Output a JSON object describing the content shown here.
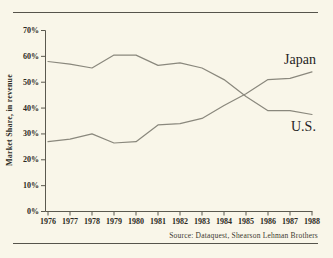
{
  "chart_data": {
    "type": "line",
    "x": [
      1976,
      1977,
      1978,
      1979,
      1980,
      1981,
      1982,
      1983,
      1984,
      1985,
      1986,
      1987,
      1988
    ],
    "xtick_labels": [
      "1976",
      "1977",
      "1978",
      "1979",
      "1980",
      "1981",
      "1982",
      "1983",
      "1984",
      "1985",
      "1986",
      "1987",
      "1988"
    ],
    "series": [
      {
        "name": "U.S.",
        "values": [
          58,
          57,
          55.5,
          60.5,
          60.5,
          56.5,
          57.5,
          55.5,
          51,
          44.5,
          39,
          39,
          37.5
        ]
      },
      {
        "name": "Japan",
        "values": [
          27,
          28,
          30,
          26.5,
          27,
          33.5,
          34,
          36,
          41,
          45.5,
          51,
          51.5,
          54
        ]
      }
    ],
    "ylabel": "Market Share, in revenue",
    "ylim": [
      0,
      70
    ],
    "ytick_step": 10,
    "ytick_labels": [
      "0%",
      "10%",
      "20%",
      "30%",
      "40%",
      "50%",
      "60%",
      "70%"
    ],
    "grid": false,
    "legend_position": "inline-right-labels",
    "source": "Source: Dataquest, Shearson Lehman Brothers",
    "colors": {
      "background": "#f9f6e9",
      "line": "#8a887d",
      "axis": "#5b594f",
      "text": "#2b2922",
      "rule": "#56544b"
    }
  }
}
